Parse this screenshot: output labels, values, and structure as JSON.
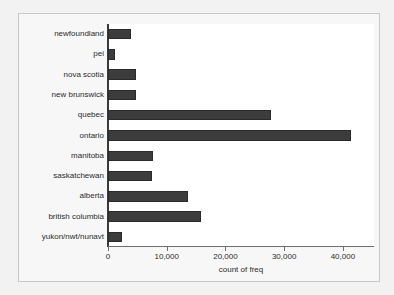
{
  "chart_data": {
    "type": "bar",
    "orientation": "horizontal",
    "title": "",
    "xlabel": "count of freq",
    "ylabel": "",
    "categories": [
      "newfoundland",
      "pei",
      "nova scotia",
      "new brunswick",
      "quebec",
      "ontario",
      "manitoba",
      "saskatchewan",
      "alberta",
      "british columbia",
      "yukon/nwt/nunavt"
    ],
    "values": [
      3900,
      1250,
      4700,
      4750,
      27700,
      41300,
      7600,
      7550,
      13600,
      15800,
      2350
    ],
    "xlim": [
      0,
      45300
    ],
    "xticks": [
      0,
      10000,
      20000,
      30000,
      40000
    ],
    "xticklabels": [
      "0",
      "10,000",
      "20,000",
      "30,000",
      "40,000"
    ],
    "grid": false,
    "legend": null,
    "bar_color": "#3c3c3c",
    "plot_background": "#ffffff",
    "graph_background": "#f7f7f7",
    "axis_color": "#3a3a3a"
  }
}
